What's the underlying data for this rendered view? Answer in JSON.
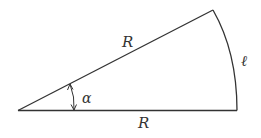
{
  "diagram": {
    "labels": {
      "upper_radius": "R",
      "lower_radius": "R",
      "arc_length": "ℓ",
      "angle": "α"
    },
    "colors": {
      "stroke": "#333333",
      "background": "#ffffff"
    }
  }
}
